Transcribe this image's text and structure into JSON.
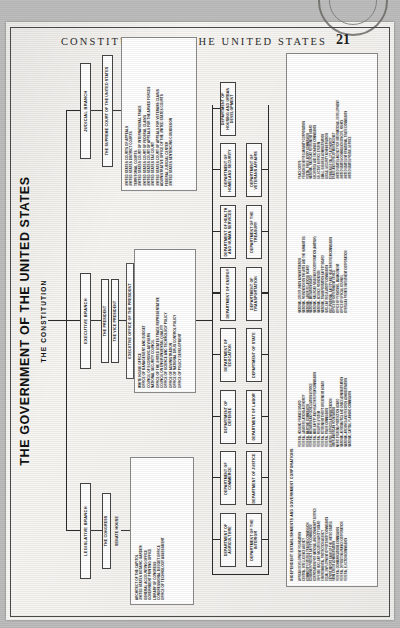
{
  "page": {
    "running_head": "CONSTITUTION OF THE UNITED STATES",
    "folio": "21"
  },
  "chart": {
    "title": "THE GOVERNMENT OF THE UNITED STATES",
    "subtitle": "THE CONSTITUTION",
    "branches": {
      "legislative": "LEGISLATIVE BRANCH",
      "executive": "EXECUTIVE BRANCH",
      "judicial": "JUDICIAL BRANCH"
    },
    "legislative": {
      "head": "THE CONGRESS",
      "chambers": "SENATE   HOUSE",
      "agencies": [
        "ARCHITECT OF THE CAPITOL",
        "UNITED STATES BOTANIC GARDEN",
        "GENERAL ACCOUNTING OFFICE",
        "GOVERNMENT PRINTING OFFICE",
        "LIBRARY OF CONGRESS",
        "CONGRESSIONAL BUDGET OFFICE",
        "OFFICE OF TECHNOLOGY ASSESSMENT"
      ]
    },
    "executive": {
      "president": "THE PRESIDENT",
      "vice_president": "THE VICE PRESIDENT",
      "eop_head": "EXECUTIVE OFFICE OF THE PRESIDENT",
      "eop_items": [
        "WHITE HOUSE OFFICE",
        "OFFICE OF MANAGEMENT AND BUDGET",
        "COUNCIL OF ECONOMIC ADVISERS",
        "NATIONAL SECURITY COUNCIL",
        "OFFICE OF THE UNITED STATES TRADE REPRESENTATIVE",
        "COUNCIL ON ENVIRONMENTAL QUALITY",
        "OFFICE OF SCIENCE AND TECHNOLOGY POLICY",
        "OFFICE OF ADMINISTRATION",
        "OFFICE OF NATIONAL DRUG CONTROL POLICY",
        "OFFICE OF POLICY DEVELOPMENT"
      ]
    },
    "judicial": {
      "supreme": "THE SUPREME COURT OF THE UNITED STATES",
      "courts": [
        "UNITED STATES COURTS OF APPEALS",
        "UNITED STATES DISTRICT COURTS",
        "TERRITORIAL COURTS",
        "UNITED STATES COURT OF INTERNATIONAL TRADE",
        "UNITED STATES COURT OF FEDERAL CLAIMS",
        "UNITED STATES COURT OF APPEALS FOR THE ARMED FORCES",
        "UNITED STATES TAX COURT",
        "UNITED STATES COURT OF APPEALS FOR VETERANS CLAIMS",
        "ADMINISTRATIVE OFFICE OF THE UNITED STATES COURTS",
        "FEDERAL JUDICIAL CENTER",
        "UNITED STATES SENTENCING COMMISSION"
      ]
    },
    "departments": [
      "DEPARTMENT OF AGRICULTURE",
      "DEPARTMENT OF COMMERCE",
      "DEPARTMENT OF DEFENSE",
      "DEPARTMENT OF EDUCATION",
      "DEPARTMENT OF ENERGY",
      "DEPARTMENT OF HEALTH AND HUMAN SERVICES",
      "DEPARTMENT OF HOMELAND SECURITY",
      "DEPARTMENT OF HOUSING AND URBAN DEVELOPMENT",
      "DEPARTMENT OF THE INTERIOR",
      "DEPARTMENT OF JUSTICE",
      "DEPARTMENT OF LABOR",
      "DEPARTMENT OF STATE",
      "DEPARTMENT OF TRANSPORTATION",
      "DEPARTMENT OF THE TREASURY",
      "DEPARTMENT OF VETERANS AFFAIRS"
    ],
    "independent": {
      "heading": "INDEPENDENT ESTABLISHMENTS AND GOVERNMENT CORPORATIONS",
      "col1": [
        "AFRICAN DEVELOPMENT FOUNDATION",
        "CENTRAL INTELLIGENCE AGENCY",
        "COMMODITY FUTURES TRADING COMMISSION",
        "CONSUMER PRODUCT SAFETY COMMISSION",
        "CORPORATION FOR NATIONAL AND COMMUNITY SERVICE",
        "DEFENSE NUCLEAR FACILITIES SAFETY BOARD",
        "ENVIRONMENTAL PROTECTION AGENCY",
        "EQUAL EMPLOYMENT OPPORTUNITY COMMISSION",
        "EXPORT-IMPORT BANK OF THE UNITED STATES",
        "FARM CREDIT ADMINISTRATION",
        "FEDERAL COMMUNICATIONS COMMISSION",
        "FEDERAL DEPOSIT INSURANCE CORPORATION",
        "FEDERAL ELECTION COMMISSION"
      ],
      "col2": [
        "FEDERAL HOUSING FINANCE BOARD",
        "FEDERAL LABOR RELATIONS AUTHORITY",
        "FEDERAL MARITIME COMMISSION",
        "FEDERAL MEDIATION AND CONCILIATION SERVICE",
        "FEDERAL MINE SAFETY AND HEALTH REVIEW COMMISSION",
        "FEDERAL RESERVE SYSTEM",
        "FEDERAL RETIREMENT THRIFT INVESTMENT BOARD",
        "FEDERAL TRADE COMMISSION",
        "GENERAL SERVICES ADMINISTRATION",
        "INTER-AMERICAN FOUNDATION",
        "MERIT SYSTEMS PROTECTION BOARD",
        "NATIONAL AERONAUTICS AND SPACE ADMINISTRATION",
        "NATIONAL ARCHIVES AND RECORDS ADMINISTRATION",
        "NATIONAL CAPITAL PLANNING COMMISSION"
      ],
      "col3": [
        "NATIONAL CREDIT UNION ADMINISTRATION",
        "NATIONAL FOUNDATION ON THE ARTS AND THE HUMANITIES",
        "NATIONAL LABOR RELATIONS BOARD",
        "NATIONAL MEDIATION BOARD",
        "NATIONAL RAILROAD PASSENGER CORPORATION (AMTRAK)",
        "NATIONAL SCIENCE FOUNDATION",
        "NATIONAL TRANSPORTATION SAFETY BOARD",
        "NUCLEAR REGULATORY COMMISSION",
        "OCCUPATIONAL SAFETY AND HEALTH REVIEW COMMISSION",
        "OFFICE OF GOVERNMENT ETHICS",
        "OFFICE OF PERSONNEL MANAGEMENT",
        "OFFICE OF SPECIAL COUNSEL",
        "OVERSEAS PRIVATE INVESTMENT CORPORATION"
      ],
      "col4": [
        "PEACE CORPS",
        "PENSION BENEFIT GUARANTY CORPORATION",
        "POSTAL REGULATORY COMMISSION",
        "NATIONAL RAILROAD RETIREMENT BOARD",
        "SECURITIES AND EXCHANGE COMMISSION",
        "SELECTIVE SERVICE SYSTEM",
        "SMALL BUSINESS ADMINISTRATION",
        "SOCIAL SECURITY ADMINISTRATION",
        "TENNESSEE VALLEY AUTHORITY",
        "TRADE AND DEVELOPMENT AGENCY",
        "UNITED STATES AGENCY FOR INTERNATIONAL DEVELOPMENT",
        "UNITED STATES COMMISSION ON CIVIL RIGHTS",
        "UNITED STATES INTERNATIONAL TRADE COMMISSION",
        "UNITED STATES POSTAL SERVICE"
      ]
    }
  }
}
